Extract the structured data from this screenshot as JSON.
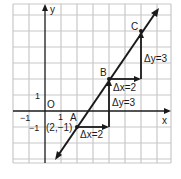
{
  "diagram": {
    "axes": {
      "x_label": "x",
      "y_label": "y",
      "origin_label": "O"
    },
    "ticks": {
      "x_neg1": "−1",
      "x_pos1": "1",
      "y_pos1": "1",
      "y_neg1": "−1"
    },
    "points": {
      "A": {
        "label": "A",
        "coord_label": "(2,−1)",
        "x": 2,
        "y": -1
      },
      "B": {
        "label": "B",
        "x": 4,
        "y": 2
      },
      "C": {
        "label": "C",
        "x": 6,
        "y": 5
      }
    },
    "steps": {
      "dx1": "Δx=2",
      "dy1": "Δy=3",
      "dx2": "Δx=2",
      "dy2": "Δy=3"
    },
    "colors": {
      "grid": "#c8c8c8",
      "ink": "#1a1a1a",
      "background": "#ffffff"
    }
  }
}
